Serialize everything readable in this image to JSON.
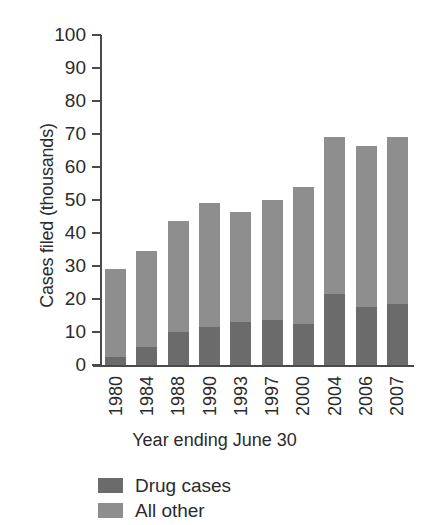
{
  "chart_data": {
    "type": "bar",
    "stacked": true,
    "title": "",
    "xlabel": "Year ending June 30",
    "ylabel": "Cases filed (thousands)",
    "categories": [
      "1980",
      "1984",
      "1988",
      "1990",
      "1993",
      "1997",
      "2000",
      "2004",
      "2006",
      "2007"
    ],
    "series": [
      {
        "name": "Drug cases",
        "color": "#6b6b6b",
        "values": [
          2.5,
          5.5,
          10.0,
          11.5,
          13.0,
          13.5,
          12.5,
          21.5,
          17.5,
          18.5
        ]
      },
      {
        "name": "All other",
        "color": "#8e8e8e",
        "values": [
          26.5,
          29.0,
          33.5,
          37.5,
          33.5,
          36.5,
          41.5,
          47.5,
          49.0,
          50.5
        ]
      }
    ],
    "totals": [
      29.0,
      34.5,
      43.5,
      49.0,
      46.5,
      50.0,
      54.0,
      69.0,
      66.5,
      69.0
    ],
    "ylim": [
      0,
      100
    ],
    "ytick_step": 10,
    "ytick_labels": [
      "100",
      "90",
      "80",
      "70",
      "60",
      "50",
      "40",
      "30",
      "20",
      "10",
      "0"
    ],
    "grid": false,
    "legend_position": "bottom-left"
  },
  "legend": {
    "items": [
      {
        "label": "Drug cases",
        "color": "#6b6b6b"
      },
      {
        "label": "All other",
        "color": "#8e8e8e"
      }
    ]
  },
  "axes": {
    "y_title": "Cases filed (thousands)",
    "x_title": "Year ending June 30"
  }
}
